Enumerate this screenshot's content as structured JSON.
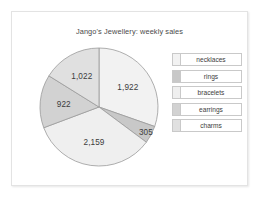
{
  "chart_data": {
    "type": "pie",
    "title": "Jango's Jewellery: weekly sales",
    "categories": [
      "necklaces",
      "rings",
      "bracelets",
      "earrings",
      "charms"
    ],
    "values": [
      1922,
      305,
      2159,
      922,
      1022
    ],
    "value_labels": [
      "1,922",
      "305",
      "2,159",
      "922",
      "1,022"
    ],
    "total": 6330,
    "colors": [
      "#f2f2f2",
      "#c8c8c8",
      "#efefef",
      "#d2d2d2",
      "#e0e0e0"
    ],
    "slice_stroke": "#9a9a9a",
    "legend_position": "right",
    "start_angle": 0,
    "direction": "clockwise",
    "grid": false,
    "xlabel": "",
    "ylabel": ""
  },
  "legend": {
    "items": [
      {
        "label": "necklaces",
        "color": "#f2f2f2"
      },
      {
        "label": "rings",
        "color": "#c8c8c8"
      },
      {
        "label": "bracelets",
        "color": "#efefef"
      },
      {
        "label": "earrings",
        "color": "#d2d2d2"
      },
      {
        "label": "charms",
        "color": "#e0e0e0"
      }
    ]
  }
}
